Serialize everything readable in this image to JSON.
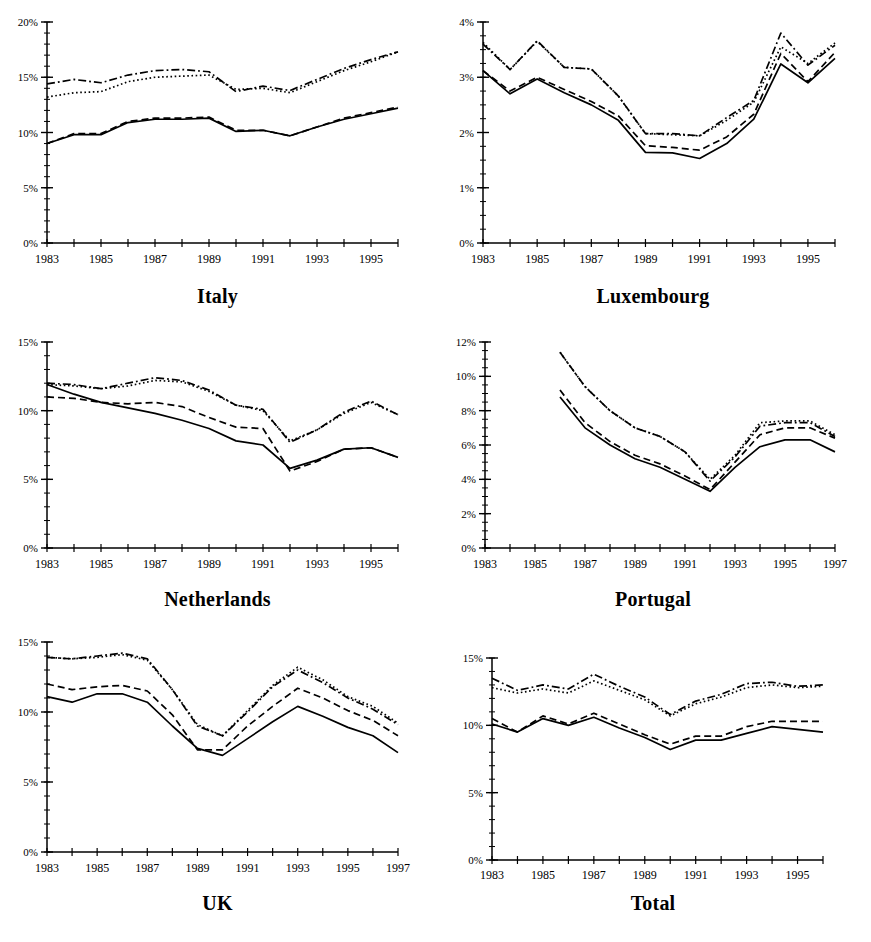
{
  "figure": {
    "layout": "2 columns x 3 rows of line charts",
    "panel_order": [
      "Italy",
      "Luxembourg",
      "Netherlands",
      "Portugal",
      "UK",
      "Total"
    ]
  },
  "series_styles": [
    {
      "name": "series-1",
      "dash": "solid",
      "color": "#000000"
    },
    {
      "name": "series-2",
      "dash": "dashed",
      "color": "#000000"
    },
    {
      "name": "series-3",
      "dash": "dotted",
      "color": "#000000"
    },
    {
      "name": "series-4",
      "dash": "dash-dot",
      "color": "#000000"
    }
  ],
  "chart_data": [
    {
      "type": "line",
      "title": "Italy",
      "xlabel": "",
      "ylabel": "",
      "xlim": [
        1983,
        1996
      ],
      "ylim": [
        0,
        20
      ],
      "ytick_labels": [
        "0%",
        "5%",
        "10%",
        "15%",
        "20%"
      ],
      "ytick_values": [
        0,
        5,
        10,
        15,
        20
      ],
      "yminor_step": 1,
      "xtick_labels": [
        "1983",
        "1985",
        "1987",
        "1989",
        "1991",
        "1993",
        "1995"
      ],
      "xtick_values": [
        1983,
        1985,
        1987,
        1989,
        1991,
        1993,
        1995
      ],
      "xminor_step": 1,
      "grid": false,
      "legend": "none",
      "x": [
        1983,
        1984,
        1985,
        1986,
        1987,
        1988,
        1989,
        1990,
        1991,
        1992,
        1993,
        1994,
        1995,
        1996
      ],
      "series": [
        {
          "name": "series-1",
          "dash": "solid",
          "values": [
            9.0,
            9.8,
            9.8,
            10.9,
            11.2,
            11.2,
            11.3,
            10.1,
            10.2,
            9.7,
            10.5,
            11.2,
            11.7,
            12.2
          ]
        },
        {
          "name": "series-2",
          "dash": "dashed",
          "values": [
            9.0,
            9.9,
            9.9,
            11.0,
            11.3,
            11.3,
            11.4,
            10.2,
            10.2,
            9.7,
            10.5,
            11.3,
            11.8,
            12.3
          ]
        },
        {
          "name": "series-3",
          "dash": "dotted",
          "values": [
            13.2,
            13.6,
            13.7,
            14.6,
            15.0,
            15.1,
            15.2,
            13.9,
            14.0,
            13.6,
            14.6,
            15.6,
            16.4,
            17.3
          ]
        },
        {
          "name": "series-4",
          "dash": "dash-dot",
          "values": [
            14.4,
            14.8,
            14.5,
            15.2,
            15.6,
            15.7,
            15.5,
            13.7,
            14.2,
            13.8,
            14.8,
            15.8,
            16.6,
            17.3
          ]
        }
      ]
    },
    {
      "type": "line",
      "title": "Luxembourg",
      "xlabel": "",
      "ylabel": "",
      "xlim": [
        1983,
        1996
      ],
      "ylim": [
        0,
        4
      ],
      "ytick_labels": [
        "0%",
        "1%",
        "2%",
        "3%",
        "4%"
      ],
      "ytick_values": [
        0,
        1,
        2,
        3,
        4
      ],
      "yminor_step": 0.25,
      "xtick_labels": [
        "1983",
        "1985",
        "1987",
        "1989",
        "1991",
        "1993",
        "1995"
      ],
      "xtick_values": [
        1983,
        1985,
        1987,
        1989,
        1991,
        1993,
        1995
      ],
      "xminor_step": 1,
      "grid": false,
      "legend": "none",
      "x": [
        1983,
        1984,
        1985,
        1986,
        1987,
        1988,
        1989,
        1990,
        1991,
        1992,
        1993,
        1994,
        1995,
        1996
      ],
      "series": [
        {
          "name": "series-1",
          "dash": "solid",
          "values": [
            3.12,
            2.7,
            2.97,
            2.72,
            2.5,
            2.22,
            1.64,
            1.63,
            1.53,
            1.8,
            2.24,
            3.24,
            2.9,
            3.34
          ]
        },
        {
          "name": "series-2",
          "dash": "dashed",
          "values": [
            3.12,
            2.75,
            3.0,
            2.78,
            2.56,
            2.3,
            1.76,
            1.73,
            1.68,
            1.92,
            2.33,
            3.43,
            2.92,
            3.45
          ]
        },
        {
          "name": "series-3",
          "dash": "dotted",
          "values": [
            3.63,
            3.14,
            3.65,
            3.18,
            3.15,
            2.66,
            1.98,
            1.96,
            1.94,
            2.22,
            2.55,
            3.55,
            3.25,
            3.62
          ]
        },
        {
          "name": "series-4",
          "dash": "dash-dot",
          "values": [
            3.6,
            3.14,
            3.66,
            3.18,
            3.15,
            2.66,
            1.98,
            1.98,
            1.94,
            2.27,
            2.58,
            3.8,
            3.22,
            3.58
          ]
        }
      ]
    },
    {
      "type": "line",
      "title": "Netherlands",
      "xlabel": "",
      "ylabel": "",
      "xlim": [
        1983,
        1996
      ],
      "ylim": [
        0,
        15
      ],
      "ytick_labels": [
        "0%",
        "5%",
        "10%",
        "15%"
      ],
      "ytick_values": [
        0,
        5,
        10,
        15
      ],
      "yminor_step": 1,
      "xtick_labels": [
        "1983",
        "1985",
        "1987",
        "1989",
        "1991",
        "1993",
        "1995"
      ],
      "xtick_values": [
        1983,
        1985,
        1987,
        1989,
        1991,
        1993,
        1995
      ],
      "xminor_step": 1,
      "grid": false,
      "legend": "none",
      "x": [
        1983,
        1984,
        1985,
        1986,
        1987,
        1988,
        1989,
        1990,
        1991,
        1992,
        1993,
        1994,
        1995,
        1996
      ],
      "series": [
        {
          "name": "series-1",
          "dash": "solid",
          "values": [
            11.9,
            11.2,
            10.6,
            10.2,
            9.8,
            9.3,
            8.7,
            7.8,
            7.5,
            5.8,
            6.4,
            7.2,
            7.3,
            6.6
          ]
        },
        {
          "name": "series-2",
          "dash": "dashed",
          "values": [
            11.0,
            10.9,
            10.6,
            10.5,
            10.6,
            10.3,
            9.5,
            8.8,
            8.7,
            5.6,
            6.3,
            7.2,
            7.3,
            6.6
          ]
        },
        {
          "name": "series-3",
          "dash": "dotted",
          "values": [
            11.9,
            11.8,
            11.6,
            11.8,
            12.2,
            12.1,
            11.4,
            10.4,
            10.0,
            7.8,
            8.6,
            9.8,
            10.6,
            9.7
          ]
        },
        {
          "name": "series-4",
          "dash": "dash-dot",
          "values": [
            12.0,
            11.9,
            11.6,
            12.0,
            12.4,
            12.2,
            11.5,
            10.4,
            10.1,
            7.7,
            8.6,
            9.9,
            10.7,
            9.7
          ]
        }
      ]
    },
    {
      "type": "line",
      "title": "Portugal",
      "xlabel": "",
      "ylabel": "",
      "xlim": [
        1983,
        1997
      ],
      "ylim": [
        0,
        12
      ],
      "ytick_labels": [
        "0%",
        "2%",
        "4%",
        "6%",
        "8%",
        "10%",
        "12%"
      ],
      "ytick_values": [
        0,
        2,
        4,
        6,
        8,
        10,
        12
      ],
      "yminor_step": 0.5,
      "xtick_labels": [
        "1983",
        "1985",
        "1987",
        "1989",
        "1991",
        "1993",
        "1995",
        "1997"
      ],
      "xtick_values": [
        1983,
        1985,
        1987,
        1989,
        1991,
        1993,
        1995,
        1997
      ],
      "xminor_step": 1,
      "grid": false,
      "legend": "none",
      "x": [
        1986,
        1987,
        1988,
        1989,
        1990,
        1991,
        1992,
        1993,
        1994,
        1995,
        1996,
        1997
      ],
      "series": [
        {
          "name": "series-1",
          "dash": "solid",
          "values": [
            8.8,
            7.0,
            6.0,
            5.2,
            4.7,
            4.0,
            3.3,
            4.7,
            5.9,
            6.3,
            6.3,
            5.6
          ]
        },
        {
          "name": "series-2",
          "dash": "dashed",
          "values": [
            9.2,
            7.3,
            6.2,
            5.4,
            4.9,
            4.2,
            3.4,
            5.0,
            6.6,
            7.0,
            7.0,
            6.4
          ]
        },
        {
          "name": "series-3",
          "dash": "dotted",
          "values": [
            11.4,
            9.4,
            8.0,
            7.0,
            6.5,
            5.6,
            4.0,
            5.4,
            7.3,
            7.4,
            7.4,
            6.6
          ]
        },
        {
          "name": "series-4",
          "dash": "dash-dot",
          "values": [
            11.4,
            9.4,
            8.0,
            7.0,
            6.5,
            5.6,
            3.9,
            5.3,
            7.1,
            7.3,
            7.3,
            6.5
          ]
        }
      ]
    },
    {
      "type": "line",
      "title": "UK",
      "xlabel": "",
      "ylabel": "",
      "xlim": [
        1983,
        1997
      ],
      "ylim": [
        0,
        15
      ],
      "ytick_labels": [
        "0%",
        "5%",
        "10%",
        "15%"
      ],
      "ytick_values": [
        0,
        5,
        10,
        15
      ],
      "yminor_step": 1,
      "xtick_labels": [
        "1983",
        "1985",
        "1987",
        "1989",
        "1991",
        "1993",
        "1995",
        "1997"
      ],
      "xtick_values": [
        1983,
        1985,
        1987,
        1989,
        1991,
        1993,
        1995,
        1997
      ],
      "xminor_step": 1,
      "grid": false,
      "legend": "none",
      "x": [
        1983,
        1984,
        1985,
        1986,
        1987,
        1988,
        1989,
        1990,
        1991,
        1992,
        1993,
        1994,
        1995,
        1996,
        1997
      ],
      "series": [
        {
          "name": "series-1",
          "dash": "solid",
          "values": [
            11.1,
            10.7,
            11.3,
            11.3,
            10.7,
            9.0,
            7.4,
            6.9,
            8.1,
            9.3,
            10.4,
            9.7,
            8.9,
            8.3,
            7.1
          ]
        },
        {
          "name": "series-2",
          "dash": "dashed",
          "values": [
            12.0,
            11.6,
            11.8,
            11.9,
            11.5,
            9.8,
            7.3,
            7.3,
            9.0,
            10.4,
            11.7,
            11.0,
            10.1,
            9.4,
            8.3
          ]
        },
        {
          "name": "series-3",
          "dash": "dotted",
          "values": [
            13.9,
            13.8,
            13.9,
            14.1,
            13.7,
            11.6,
            9.1,
            8.3,
            10.1,
            11.9,
            13.2,
            12.3,
            11.1,
            10.4,
            9.2
          ]
        },
        {
          "name": "series-4",
          "dash": "dash-dot",
          "values": [
            13.9,
            13.8,
            14.0,
            14.2,
            13.8,
            11.6,
            9.0,
            8.3,
            10.0,
            11.8,
            13.0,
            12.1,
            11.0,
            10.2,
            9.1
          ]
        }
      ]
    },
    {
      "type": "line",
      "title": "Total",
      "xlabel": "",
      "ylabel": "",
      "xlim": [
        1983,
        1996
      ],
      "ylim": [
        0,
        15
      ],
      "ytick_labels": [
        "0%",
        "5%",
        "10%",
        "15%"
      ],
      "ytick_values": [
        0,
        5,
        10,
        15
      ],
      "yminor_step": 1,
      "xtick_labels": [
        "1983",
        "1985",
        "1987",
        "1989",
        "1991",
        "1993",
        "1995"
      ],
      "xtick_values": [
        1983,
        1985,
        1987,
        1989,
        1991,
        1993,
        1995
      ],
      "xminor_step": 1,
      "grid": false,
      "legend": "none",
      "x": [
        1983,
        1984,
        1985,
        1986,
        1987,
        1988,
        1989,
        1990,
        1991,
        1992,
        1993,
        1994,
        1995,
        1996
      ],
      "series": [
        {
          "name": "series-1",
          "dash": "solid",
          "values": [
            10.1,
            9.5,
            10.5,
            10.0,
            10.6,
            9.8,
            9.1,
            8.2,
            8.9,
            8.9,
            9.4,
            9.9,
            9.7,
            9.5
          ]
        },
        {
          "name": "series-2",
          "dash": "dashed",
          "values": [
            10.5,
            9.5,
            10.7,
            10.1,
            10.9,
            10.1,
            9.3,
            8.6,
            9.2,
            9.2,
            9.9,
            10.3,
            10.3,
            10.3
          ]
        },
        {
          "name": "series-3",
          "dash": "dotted",
          "values": [
            12.8,
            12.4,
            12.7,
            12.4,
            13.3,
            12.6,
            11.9,
            10.7,
            11.6,
            12.1,
            12.8,
            13.0,
            12.8,
            12.9
          ]
        },
        {
          "name": "series-4",
          "dash": "dash-dot",
          "values": [
            13.5,
            12.6,
            13.0,
            12.7,
            13.8,
            12.9,
            12.1,
            10.8,
            11.8,
            12.3,
            13.1,
            13.2,
            12.9,
            13.0
          ]
        }
      ]
    }
  ]
}
